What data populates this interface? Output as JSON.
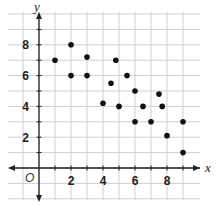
{
  "chart_data": {
    "type": "scatter",
    "title": "",
    "xlabel": "x",
    "ylabel": "y",
    "origin_label": "O",
    "xlim": [
      -1.5,
      9.8
    ],
    "ylim": [
      -1.5,
      10
    ],
    "x_ticks": [
      2,
      4,
      6,
      8
    ],
    "y_ticks": [
      2,
      4,
      6,
      8
    ],
    "grid": true,
    "points": [
      {
        "x": 1,
        "y": 7
      },
      {
        "x": 2,
        "y": 8
      },
      {
        "x": 2,
        "y": 6
      },
      {
        "x": 3,
        "y": 7.2
      },
      {
        "x": 3,
        "y": 6
      },
      {
        "x": 4,
        "y": 4.2
      },
      {
        "x": 4.5,
        "y": 5.5
      },
      {
        "x": 4.8,
        "y": 7
      },
      {
        "x": 5,
        "y": 4
      },
      {
        "x": 5.5,
        "y": 6
      },
      {
        "x": 6,
        "y": 5
      },
      {
        "x": 6,
        "y": 3
      },
      {
        "x": 6.5,
        "y": 4
      },
      {
        "x": 7,
        "y": 3
      },
      {
        "x": 7.5,
        "y": 4.8
      },
      {
        "x": 7.7,
        "y": 4
      },
      {
        "x": 8,
        "y": 2.1
      },
      {
        "x": 9,
        "y": 3
      },
      {
        "x": 9,
        "y": 1
      }
    ],
    "colors": {
      "grid": "#cfcfcf",
      "axis": "#222222",
      "point": "#111111",
      "text": "#222222"
    }
  }
}
